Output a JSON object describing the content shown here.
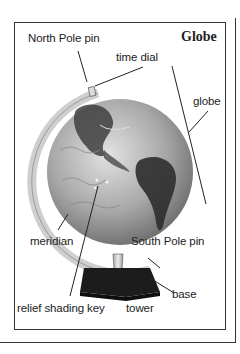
{
  "title": "Globe",
  "labels": {
    "north_pole_pin": "North Pole pin",
    "time_dial": "time dial",
    "globe": "globe",
    "meridian": "meridian",
    "south_pole_pin": "South Pole pin",
    "base": "base",
    "relief_shading_key": "relief shading key",
    "tower": "tower"
  },
  "colors": {
    "ink": "#222222",
    "globe_light": "#cfcfcf",
    "globe_dark": "#3a3a3a",
    "base": "#1a1a1a",
    "meridian": "#e4e4e4"
  }
}
